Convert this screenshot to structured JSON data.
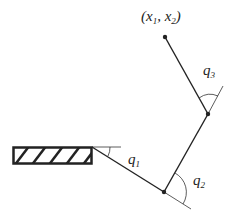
{
  "diagram": {
    "end_effector_label": {
      "open": "(",
      "x": "x",
      "x_sub": "1",
      "sep": ", ",
      "y": "x",
      "y_sub": "2",
      "close": ")"
    },
    "joint_labels": [
      {
        "name": "q",
        "sub": "1"
      },
      {
        "name": "q",
        "sub": "2"
      },
      {
        "name": "q",
        "sub": "3"
      }
    ],
    "components": [
      "fixed-base",
      "link-1",
      "link-2",
      "link-3",
      "joint-1",
      "joint-2",
      "end-effector"
    ],
    "colors": {
      "ink": "#222222",
      "background": "#ffffff"
    }
  }
}
